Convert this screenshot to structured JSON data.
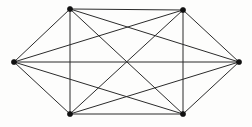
{
  "figure": {
    "name": "complete-graph-k6",
    "background_color": "#fdfdfc",
    "edge_color": "#2b2b2b",
    "vertex_color": "#111111",
    "edge_width": 1,
    "vertex_radius": 2.6,
    "width": 252,
    "height": 127
  },
  "graph_data": {
    "type": "graph",
    "graph_name": "K6",
    "vertex_count": 6,
    "edge_count": 15,
    "complete": true,
    "layout": "hexagonal",
    "vertices": [
      {
        "id": "v1",
        "label": "left",
        "x": 14,
        "y": 62
      },
      {
        "id": "v2",
        "label": "top-left",
        "x": 70,
        "y": 9
      },
      {
        "id": "v3",
        "label": "top-right",
        "x": 183,
        "y": 10
      },
      {
        "id": "v4",
        "label": "right",
        "x": 239,
        "y": 62
      },
      {
        "id": "v5",
        "label": "bottom-right",
        "x": 183,
        "y": 114
      },
      {
        "id": "v6",
        "label": "bottom-left",
        "x": 70,
        "y": 114
      }
    ],
    "edges": [
      {
        "from": "v1",
        "to": "v2"
      },
      {
        "from": "v1",
        "to": "v3"
      },
      {
        "from": "v1",
        "to": "v4"
      },
      {
        "from": "v1",
        "to": "v5"
      },
      {
        "from": "v1",
        "to": "v6"
      },
      {
        "from": "v2",
        "to": "v3"
      },
      {
        "from": "v2",
        "to": "v4"
      },
      {
        "from": "v2",
        "to": "v5"
      },
      {
        "from": "v2",
        "to": "v6"
      },
      {
        "from": "v3",
        "to": "v4"
      },
      {
        "from": "v3",
        "to": "v5"
      },
      {
        "from": "v3",
        "to": "v6"
      },
      {
        "from": "v4",
        "to": "v5"
      },
      {
        "from": "v4",
        "to": "v6"
      },
      {
        "from": "v5",
        "to": "v6"
      }
    ]
  }
}
